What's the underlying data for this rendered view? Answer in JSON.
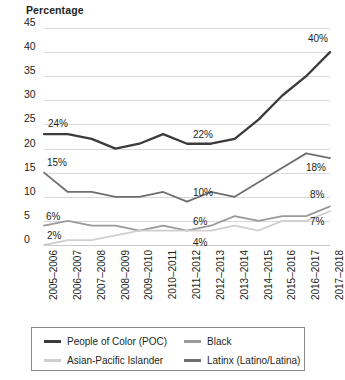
{
  "chart_data": {
    "type": "line",
    "title": "",
    "ylabel": "Percentage",
    "xlabel": "",
    "ylim": [
      0,
      45
    ],
    "yticks": [
      0,
      5,
      10,
      15,
      20,
      25,
      30,
      35,
      40,
      45
    ],
    "grid": true,
    "legend_position": "bottom",
    "categories": [
      "2005–2006",
      "2006–2007",
      "2007–2008",
      "2008–2009",
      "2009–2010",
      "2010–2011",
      "2011–2012",
      "2012–2013",
      "2013–2014",
      "2014–2015",
      "2015–2016",
      "2016–2017",
      "2017–2018"
    ],
    "series": [
      {
        "name": "People of Color (POC)",
        "color": "#3b3b3b",
        "values": [
          23,
          23,
          22,
          20,
          21,
          23,
          21,
          21,
          22,
          26,
          31,
          35,
          40
        ],
        "labels": [
          {
            "index": 0,
            "text": "24%"
          },
          {
            "index": 6,
            "text": "22%"
          },
          {
            "index": 12,
            "text": "40%"
          }
        ]
      },
      {
        "name": "Latinx (Latino/Latina)",
        "color": "#6e6e6e",
        "values": [
          15,
          11,
          11,
          10,
          10,
          11,
          9,
          11,
          10,
          13,
          16,
          19,
          18
        ],
        "labels": [
          {
            "index": 0,
            "text": "15%"
          },
          {
            "index": 6,
            "text": "10%"
          },
          {
            "index": 12,
            "text": "18%"
          }
        ]
      },
      {
        "name": "Black",
        "color": "#9a9a9a",
        "values": [
          4,
          5,
          4,
          4,
          3,
          4,
          3,
          4,
          6,
          5,
          6,
          6,
          8
        ],
        "labels": [
          {
            "index": 0,
            "text": "6%"
          },
          {
            "index": 6,
            "text": "6%"
          },
          {
            "index": 12,
            "text": "8%"
          }
        ]
      },
      {
        "name": "Asian-Pacific Islander",
        "color": "#cfcfcf",
        "values": [
          0,
          1,
          1,
          2,
          3,
          3,
          3,
          3,
          4,
          3,
          5,
          5,
          7
        ],
        "labels": [
          {
            "index": 0,
            "text": "2%"
          },
          {
            "index": 6,
            "text": "4%"
          },
          {
            "index": 12,
            "text": "7%"
          }
        ]
      }
    ]
  },
  "legend": {
    "items": [
      {
        "label": "People of Color (POC)",
        "color": "#3b3b3b"
      },
      {
        "label": "Black",
        "color": "#9a9a9a"
      },
      {
        "label": "Asian-Pacific Islander",
        "color": "#cfcfcf"
      },
      {
        "label": "Latinx (Latino/Latina)",
        "color": "#6e6e6e"
      }
    ]
  }
}
